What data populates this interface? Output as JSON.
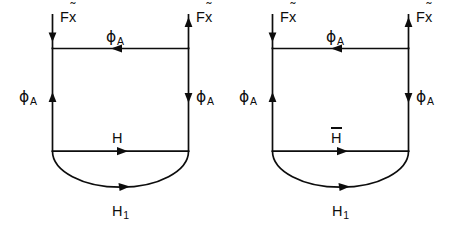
{
  "figure": {
    "background_color": "#ffffff",
    "stroke_color": "#0d0d0d",
    "diagrams": [
      {
        "id": "left-diagram",
        "middle_label": "H",
        "middle_label_has_overbar": false,
        "labels": {
          "top_left_input": "F",
          "top_left_input_var": "x",
          "top_right_output": "F",
          "top_right_output_var": "x",
          "top_flow": "ϕ",
          "top_flow_sub": "A",
          "left_flow": "ϕ",
          "left_flow_sub": "A",
          "right_flow": "ϕ",
          "right_flow_sub": "A",
          "middle_flow": "H",
          "arc_flow": "H",
          "arc_flow_sub": "1"
        }
      },
      {
        "id": "right-diagram",
        "middle_label": "H",
        "middle_label_has_overbar": true,
        "labels": {
          "top_left_input": "F",
          "top_left_input_var": "x",
          "top_right_output": "F",
          "top_right_output_var": "x",
          "top_flow": "ϕ",
          "top_flow_sub": "A",
          "left_flow": "ϕ",
          "left_flow_sub": "A",
          "right_flow": "ϕ",
          "right_flow_sub": "A",
          "middle_flow": "H",
          "arc_flow": "H",
          "arc_flow_sub": "1"
        }
      }
    ],
    "glyphs": {
      "tilde": "˜",
      "phi": "ϕ"
    }
  }
}
